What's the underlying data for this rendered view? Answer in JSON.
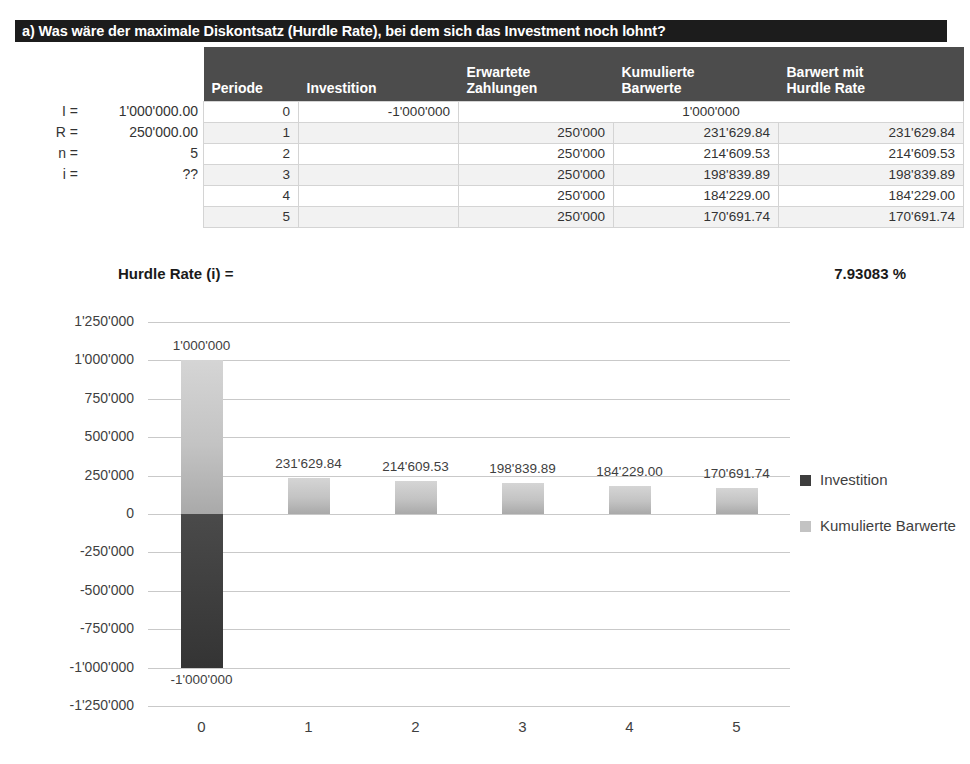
{
  "title": "a) Was wäre der maximale Diskontsatz (Hurdle Rate), bei dem sich das Investment noch lohnt?",
  "params": [
    {
      "key": "I =",
      "value": "1'000'000.00"
    },
    {
      "key": "R =",
      "value": "250'000.00"
    },
    {
      "key": "n =",
      "value": "5"
    },
    {
      "key": "i =",
      "value": "??"
    }
  ],
  "table": {
    "headers": {
      "periode": "Periode",
      "investition": "Investition",
      "erwartete_zahlungen_l1": "Erwartete",
      "erwartete_zahlungen_l2": "Zahlungen",
      "kumulierte_barwerte_l1": "Kumulierte",
      "kumulierte_barwerte_l2": "Barwerte",
      "barwert_hurdle_l1": "Barwert mit",
      "barwert_hurdle_l2": "Hurdle Rate"
    },
    "rows": [
      {
        "periode": "0",
        "investition": "-1'000'000",
        "erwartete": "",
        "kumulierte": "1'000'000",
        "barwert": "",
        "merged": true
      },
      {
        "periode": "1",
        "investition": "",
        "erwartete": "250'000",
        "kumulierte": "231'629.84",
        "barwert": "231'629.84",
        "merged": false
      },
      {
        "periode": "2",
        "investition": "",
        "erwartete": "250'000",
        "kumulierte": "214'609.53",
        "barwert": "214'609.53",
        "merged": false
      },
      {
        "periode": "3",
        "investition": "",
        "erwartete": "250'000",
        "kumulierte": "198'839.89",
        "barwert": "198'839.89",
        "merged": false
      },
      {
        "periode": "4",
        "investition": "",
        "erwartete": "250'000",
        "kumulierte": "184'229.00",
        "barwert": "184'229.00",
        "merged": false
      },
      {
        "periode": "5",
        "investition": "",
        "erwartete": "250'000",
        "kumulierte": "170'691.74",
        "barwert": "170'691.74",
        "merged": false
      }
    ]
  },
  "hurdle": {
    "label": "Hurdle Rate (i) =",
    "value": "7.93083",
    "unit": "%"
  },
  "chart_data": {
    "type": "bar",
    "title": "",
    "xlabel": "",
    "ylabel": "",
    "categories": [
      "0",
      "1",
      "2",
      "3",
      "4",
      "5"
    ],
    "ylim": [
      -1250000,
      1250000
    ],
    "ytick_labels": [
      "1'250'000",
      "1'000'000",
      "750'000",
      "500'000",
      "250'000",
      "0",
      "-250'000",
      "-500'000",
      "-750'000",
      "-1'000'000",
      "-1'250'000"
    ],
    "ytick_values": [
      1250000,
      1000000,
      750000,
      500000,
      250000,
      0,
      -250000,
      -500000,
      -750000,
      -1000000,
      -1250000
    ],
    "grid": true,
    "legend_position": "right",
    "series": [
      {
        "name": "Investition",
        "color": "#3d3d3d",
        "values": [
          -1000000,
          null,
          null,
          null,
          null,
          null
        ],
        "labels": [
          "-1'000'000",
          "",
          "",
          "",
          "",
          ""
        ]
      },
      {
        "name": "Kumulierte Barwerte",
        "color": "#c3c3c3",
        "values": [
          1000000,
          231629.84,
          214609.53,
          198839.89,
          184229.0,
          170691.74
        ],
        "labels": [
          "1'000'000",
          "231'629.84",
          "214'609.53",
          "198'839.89",
          "184'229.00",
          "170'691.74"
        ]
      }
    ]
  },
  "legend": {
    "items": [
      {
        "label": "Investition",
        "color": "#3d3d3d"
      },
      {
        "label": "Kumulierte Barwerte",
        "color": "#c3c3c3"
      }
    ]
  }
}
